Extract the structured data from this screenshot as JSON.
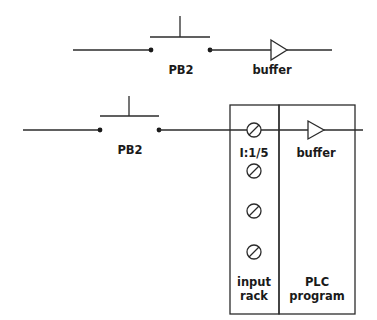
{
  "diagram": {
    "top_circuit": {
      "switch_label": "PB2",
      "buffer_label": "buffer"
    },
    "bottom_circuit": {
      "switch_label": "PB2",
      "terminal_address": "I:1/5",
      "buffer_label": "buffer",
      "input_rack_label_line1": "input",
      "input_rack_label_line2": "rack",
      "plc_program_label_line1": "PLC",
      "plc_program_label_line2": "program",
      "terminal_count": 4
    }
  }
}
